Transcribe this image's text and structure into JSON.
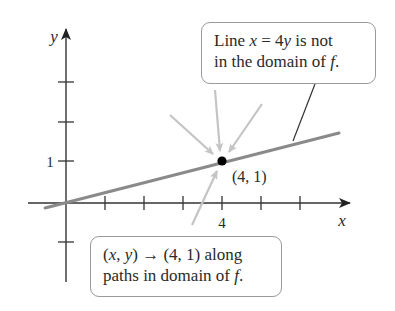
{
  "diagram": {
    "axes": {
      "x_label": "x",
      "y_label": "y",
      "x_tick_labels": [
        {
          "value": 4,
          "text": "4"
        }
      ],
      "y_tick_labels": [
        {
          "value": 1,
          "text": "1"
        }
      ]
    },
    "line": {
      "equation": "x = 4y",
      "color": "#8a8a8a"
    },
    "point": {
      "label": "(4, 1)",
      "x": 4,
      "y": 1,
      "color": "#000000"
    },
    "approach_arrows": {
      "count": 4,
      "color": "#c4c4c4"
    },
    "callouts": {
      "top": {
        "line1_pre": "Line ",
        "line1_math_x": "x",
        "line1_eq": " = 4",
        "line1_math_y": "y",
        "line1_post": " is not",
        "line2_pre": "in the domain of ",
        "line2_math_f": "f",
        "line2_post": "."
      },
      "bottom": {
        "line1_open": "(",
        "line1_math_x": "x",
        "line1_comma": ", ",
        "line1_math_y": "y",
        "line1_close": ")",
        "line1_arrow": " → ",
        "line1_post": "(4, 1) along",
        "line2_pre": "paths in domain of ",
        "line2_math_f": "f",
        "line2_post": "."
      }
    }
  }
}
